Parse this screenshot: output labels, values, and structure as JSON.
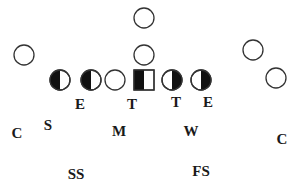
{
  "diagram": {
    "type": "football-formation",
    "stroke_color": "#333333",
    "fill_color": "#111111",
    "offense": {
      "skill_players": [
        {
          "id": "deep-back",
          "shape": "circle",
          "cx": 144,
          "cy": 18
        },
        {
          "id": "qb",
          "shape": "circle",
          "cx": 144,
          "cy": 55
        },
        {
          "id": "wide-left",
          "shape": "circle",
          "cx": 24,
          "cy": 55
        },
        {
          "id": "wing-right",
          "shape": "circle",
          "cx": 253,
          "cy": 50
        },
        {
          "id": "wide-right",
          "shape": "circle",
          "cx": 276,
          "cy": 78
        }
      ],
      "line": [
        {
          "id": "lt",
          "shape": "half-circle",
          "filled_side": "left",
          "cx": 60,
          "cy": 80
        },
        {
          "id": "lg",
          "shape": "half-circle",
          "filled_side": "left",
          "cx": 91,
          "cy": 80
        },
        {
          "id": "te-gap",
          "shape": "circle",
          "cx": 115,
          "cy": 80
        },
        {
          "id": "center",
          "shape": "half-square",
          "filled_side": "left",
          "cx": 144,
          "cy": 80
        },
        {
          "id": "rg",
          "shape": "half-circle",
          "filled_side": "right",
          "cx": 172,
          "cy": 80
        },
        {
          "id": "rt",
          "shape": "half-circle",
          "filled_side": "right",
          "cx": 201,
          "cy": 80
        }
      ]
    },
    "defense": [
      {
        "label": "E",
        "x": 80,
        "y": 109
      },
      {
        "label": "T",
        "x": 132,
        "y": 109
      },
      {
        "label": "T",
        "x": 176,
        "y": 107
      },
      {
        "label": "E",
        "x": 208,
        "y": 107
      },
      {
        "label": "S",
        "x": 48,
        "y": 130
      },
      {
        "label": "C",
        "x": 17,
        "y": 138
      },
      {
        "label": "M",
        "x": 119,
        "y": 136
      },
      {
        "label": "W",
        "x": 191,
        "y": 136
      },
      {
        "label": "C",
        "x": 282,
        "y": 144
      },
      {
        "label": "SS",
        "x": 76,
        "y": 179
      },
      {
        "label": "FS",
        "x": 201,
        "y": 176
      }
    ]
  }
}
